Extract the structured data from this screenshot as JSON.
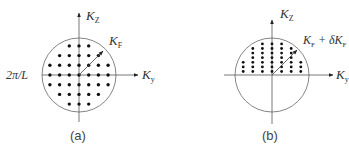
{
  "panels": [
    {
      "id": "a",
      "caption": "(a)",
      "axis_vertical_label": "K",
      "axis_vertical_sub": "Z",
      "axis_horizontal_label": "K",
      "axis_horizontal_sub": "y",
      "radius_label": "K",
      "radius_sub": "F",
      "spacing_label": "2π/L",
      "description": "Filled Fermi sphere: uniform grid of occupied k-states inside circle of radius K_F"
    },
    {
      "id": "b",
      "caption": "(b)",
      "axis_vertical_label": "K",
      "axis_vertical_sub": "Z",
      "axis_horizontal_label": "K",
      "axis_horizontal_sub": "y",
      "radius_label": "K",
      "radius_sub": "F",
      "radius_plus": " + δK",
      "radius_plus_sub": "F",
      "description": "Upper half-sphere with denser occupied states, radius K_F + δK_F"
    }
  ],
  "colors": {
    "line": "#555555",
    "dot": "#111111",
    "text": "#333333"
  }
}
